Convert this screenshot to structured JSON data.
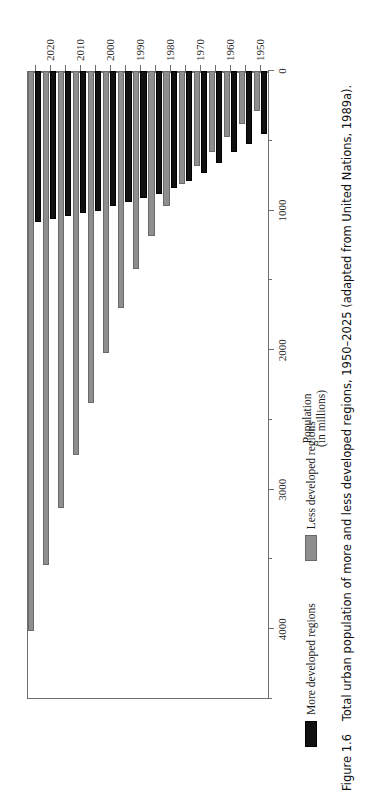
{
  "page": {
    "ghost_text": "",
    "background": "#ffffff"
  },
  "caption": {
    "figure_number": "Figure 1.6",
    "text": "Total urban population of more and less developed regions, 1950–2025 (adapted from United Nations, 1989a)."
  },
  "legend": {
    "entries": [
      {
        "label": "More developed regions",
        "color": "#111111",
        "swatch": "more"
      },
      {
        "label": "Less developed regions",
        "color": "#8e8e8e",
        "swatch": "less"
      }
    ]
  },
  "axes": {
    "value_axis_title_line1": "Population",
    "value_axis_title_line2": "(in millions)",
    "value_ticks_major": [
      "0",
      "1000",
      "2000",
      "3000",
      "4000"
    ],
    "value_ticks_minor": [
      "500",
      "1500",
      "2500",
      "3500",
      "4500"
    ],
    "category_ticks_labeled": [
      "1950",
      "1960",
      "1970",
      "1980",
      "1990",
      "2000",
      "2010",
      "2020"
    ]
  },
  "chart_data": {
    "type": "bar",
    "orientation": "horizontal",
    "title": "Total urban population of more and less developed regions, 1950–2025",
    "xlabel": "Population (in millions)",
    "ylabel": "",
    "xlim": [
      0,
      4500
    ],
    "grid": false,
    "legend_position": "below-plot",
    "categories": [
      "1950",
      "1955",
      "1960",
      "1965",
      "1970",
      "1975",
      "1980",
      "1985",
      "1990",
      "1995",
      "2000",
      "2005",
      "2010",
      "2015",
      "2020",
      "2025"
    ],
    "category_labels_shown": [
      "1950",
      "",
      "1960",
      "",
      "1970",
      "",
      "1980",
      "",
      "1990",
      "",
      "2000",
      "",
      "2010",
      "",
      "2020",
      ""
    ],
    "series": [
      {
        "name": "More developed regions",
        "color": "#111111",
        "values": [
          450,
          520,
          580,
          660,
          730,
          790,
          840,
          880,
          910,
          940,
          970,
          1000,
          1020,
          1040,
          1060,
          1080
        ]
      },
      {
        "name": "Less developed regions",
        "color": "#8e8e8e",
        "values": [
          290,
          380,
          470,
          580,
          680,
          810,
          970,
          1180,
          1420,
          1700,
          2020,
          2380,
          2750,
          3130,
          3540,
          4010
        ]
      }
    ]
  }
}
